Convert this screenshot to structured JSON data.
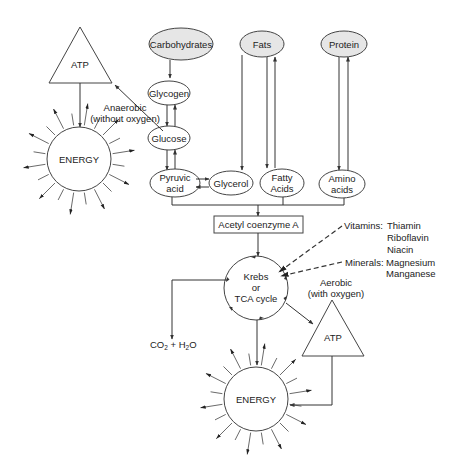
{
  "diagram": {
    "type": "metabolic-pathway",
    "sources": {
      "carbohydrates": "Carbohydrates",
      "fats": "Fats",
      "protein": "Protein"
    },
    "intermediates": {
      "glycogen": "Glycogen",
      "glucose": "Glucose",
      "pyruvic_1": "Pyruvic",
      "pyruvic_2": "acid",
      "glycerol": "Glycerol",
      "fatty_1": "Fatty",
      "fatty_2": "Acids",
      "amino_1": "Amino",
      "amino_2": "acids",
      "acetyl": "Acetyl coenzyme A"
    },
    "krebs": {
      "line1": "Krebs",
      "line2": "or",
      "line3": "TCA cycle"
    },
    "anaerobic": {
      "line1": "Anaerobic",
      "line2": "(without oxygen)",
      "atp": "ATP",
      "energy": "ENERGY"
    },
    "aerobic": {
      "line1": "Aerobic",
      "line2": "(with oxygen)",
      "atp": "ATP",
      "energy": "ENERGY"
    },
    "vitamins": {
      "label": "Vitamins:",
      "items": [
        "Thiamin",
        "Riboflavin",
        "Niacin"
      ]
    },
    "minerals": {
      "label": "Minerals:",
      "items": [
        "Magnesium",
        "Manganese"
      ]
    },
    "byproducts": {
      "co": "CO",
      "sub2a": "2",
      "plus": " + H",
      "sub2b": "2",
      "o": "O"
    }
  }
}
